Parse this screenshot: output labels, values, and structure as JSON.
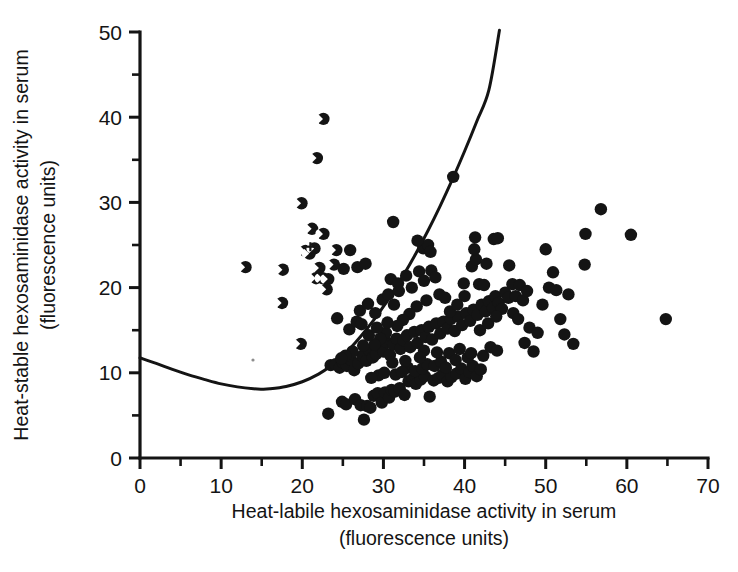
{
  "chart_data": {
    "type": "scatter",
    "title": "",
    "xlabel": "Heat-labile hexosaminidase activity in serum",
    "xlabel_units": "(fluorescence units)",
    "ylabel": "Heat-stable hexosaminidase activity in serum",
    "ylabel_units": "(fluorescence units)",
    "xlim": [
      0,
      70
    ],
    "ylim": [
      0,
      50
    ],
    "x_major_ticks": [
      0,
      10,
      20,
      30,
      40,
      50,
      60,
      70
    ],
    "x_minor_ticks": [
      5,
      15,
      25,
      35,
      45,
      55,
      65
    ],
    "y_major_ticks": [
      0,
      10,
      20,
      30,
      40,
      50
    ],
    "y_minor_ticks": [
      5,
      15,
      25,
      35,
      45
    ],
    "x_tick_labels": [
      "0",
      "10",
      "20",
      "30",
      "40",
      "50",
      "60",
      "70"
    ],
    "y_tick_labels": [
      "0",
      "10",
      "20",
      "30",
      "40",
      "50"
    ],
    "grid": false,
    "legend": "none",
    "marker_color": "#141414",
    "curve_color": "#141414",
    "series": [
      {
        "name": "filled-circle-group",
        "marker": "filled-circle",
        "points": [
          [
            23.2,
            5.2
          ],
          [
            24.9,
            6.6
          ],
          [
            25.4,
            6.3
          ],
          [
            26.5,
            6.9
          ],
          [
            27.2,
            6.2
          ],
          [
            27.6,
            4.5
          ],
          [
            28.0,
            6.1
          ],
          [
            28.4,
            5.9
          ],
          [
            28.8,
            7.3
          ],
          [
            29.3,
            7.6
          ],
          [
            29.8,
            6.5
          ],
          [
            30.2,
            7.7
          ],
          [
            30.7,
            7.1
          ],
          [
            31.0,
            8.0
          ],
          [
            31.4,
            7.8
          ],
          [
            32.0,
            8.2
          ],
          [
            32.6,
            7.4
          ],
          [
            33.1,
            9.0
          ],
          [
            33.6,
            9.3
          ],
          [
            34.0,
            8.7
          ],
          [
            34.6,
            9.2
          ],
          [
            35.1,
            9.6
          ],
          [
            35.7,
            7.2
          ],
          [
            36.2,
            9.1
          ],
          [
            36.8,
            9.4
          ],
          [
            37.3,
            9.8
          ],
          [
            37.9,
            9.0
          ],
          [
            38.4,
            9.5
          ],
          [
            39.0,
            9.9
          ],
          [
            39.6,
            10.5
          ],
          [
            40.1,
            9.3
          ],
          [
            40.6,
            10.1
          ],
          [
            41.0,
            10.8
          ],
          [
            41.5,
            9.6
          ],
          [
            42.0,
            10.4
          ],
          [
            23.5,
            10.9
          ],
          [
            24.1,
            11.0
          ],
          [
            24.6,
            10.6
          ],
          [
            25.0,
            11.2
          ],
          [
            25.5,
            10.8
          ],
          [
            26.0,
            11.5
          ],
          [
            26.4,
            10.3
          ],
          [
            26.9,
            11.1
          ],
          [
            27.4,
            12.0
          ],
          [
            27.9,
            11.4
          ],
          [
            28.3,
            12.6
          ],
          [
            28.7,
            11.8
          ],
          [
            29.1,
            12.2
          ],
          [
            29.5,
            13.1
          ],
          [
            30.0,
            12.5
          ],
          [
            30.4,
            13.6
          ],
          [
            30.8,
            12.1
          ],
          [
            31.2,
            13.3
          ],
          [
            31.6,
            14.0
          ],
          [
            32.1,
            12.8
          ],
          [
            32.5,
            13.8
          ],
          [
            32.9,
            14.4
          ],
          [
            33.3,
            13.0
          ],
          [
            33.8,
            14.8
          ],
          [
            34.2,
            13.5
          ],
          [
            34.7,
            15.0
          ],
          [
            35.2,
            14.2
          ],
          [
            35.6,
            15.4
          ],
          [
            36.0,
            13.9
          ],
          [
            36.5,
            15.8
          ],
          [
            37.0,
            14.6
          ],
          [
            37.4,
            16.0
          ],
          [
            37.9,
            15.2
          ],
          [
            38.3,
            16.3
          ],
          [
            38.8,
            14.9
          ],
          [
            39.2,
            16.6
          ],
          [
            39.7,
            15.6
          ],
          [
            40.2,
            17.0
          ],
          [
            40.7,
            16.1
          ],
          [
            41.1,
            17.4
          ],
          [
            41.6,
            16.8
          ],
          [
            42.1,
            18.0
          ],
          [
            42.6,
            17.2
          ],
          [
            43.0,
            18.4
          ],
          [
            43.5,
            17.6
          ],
          [
            24.3,
            16.4
          ],
          [
            25.8,
            15.1
          ],
          [
            26.7,
            16.0
          ],
          [
            27.1,
            17.3
          ],
          [
            28.1,
            18.1
          ],
          [
            29.0,
            17.0
          ],
          [
            29.9,
            18.6
          ],
          [
            30.6,
            19.2
          ],
          [
            31.3,
            18.0
          ],
          [
            31.9,
            19.6
          ],
          [
            30.9,
            21.0
          ],
          [
            31.8,
            20.5
          ],
          [
            32.8,
            21.4
          ],
          [
            33.5,
            20.0
          ],
          [
            34.4,
            21.9
          ],
          [
            35.0,
            20.8
          ],
          [
            35.9,
            22.0
          ],
          [
            36.4,
            21.2
          ],
          [
            34.9,
            24.6
          ],
          [
            35.5,
            25.0
          ],
          [
            34.2,
            25.5
          ],
          [
            35.8,
            24.2
          ],
          [
            31.2,
            27.7
          ],
          [
            26.8,
            22.4
          ],
          [
            27.8,
            22.8
          ],
          [
            25.9,
            24.4
          ],
          [
            25.1,
            22.2
          ],
          [
            38.6,
            33.0
          ],
          [
            43.8,
            19.0
          ],
          [
            44.2,
            18.2
          ],
          [
            44.6,
            17.5
          ],
          [
            45.0,
            19.4
          ],
          [
            45.4,
            18.8
          ],
          [
            45.9,
            20.4
          ],
          [
            46.3,
            19.0
          ],
          [
            46.8,
            20.3
          ],
          [
            47.2,
            18.5
          ],
          [
            47.7,
            19.6
          ],
          [
            41.8,
            20.4
          ],
          [
            42.4,
            20.3
          ],
          [
            40.9,
            22.5
          ],
          [
            41.4,
            23.3
          ],
          [
            41.2,
            24.5
          ],
          [
            41.3,
            25.9
          ],
          [
            43.6,
            25.7
          ],
          [
            44.1,
            25.8
          ],
          [
            42.7,
            22.8
          ],
          [
            45.5,
            22.6
          ],
          [
            46.0,
            17.0
          ],
          [
            46.6,
            16.3
          ],
          [
            47.4,
            13.5
          ],
          [
            48.0,
            15.3
          ],
          [
            48.5,
            12.5
          ],
          [
            49.0,
            14.7
          ],
          [
            49.6,
            18.0
          ],
          [
            50.0,
            24.5
          ],
          [
            50.4,
            20.0
          ],
          [
            50.9,
            21.8
          ],
          [
            51.3,
            19.7
          ],
          [
            51.8,
            16.3
          ],
          [
            52.3,
            14.5
          ],
          [
            52.8,
            19.2
          ],
          [
            53.4,
            13.4
          ],
          [
            54.8,
            22.7
          ],
          [
            54.9,
            26.3
          ],
          [
            56.8,
            29.2
          ],
          [
            60.5,
            26.2
          ],
          [
            64.8,
            16.3
          ],
          [
            38.1,
            12.3
          ],
          [
            38.9,
            11.5
          ],
          [
            39.4,
            12.8
          ],
          [
            40.4,
            11.8
          ],
          [
            40.8,
            12.3
          ],
          [
            42.3,
            12.0
          ],
          [
            43.2,
            13.0
          ],
          [
            44.0,
            12.6
          ],
          [
            33.0,
            10.6
          ],
          [
            33.9,
            10.2
          ],
          [
            34.8,
            10.5
          ],
          [
            35.4,
            11.0
          ],
          [
            36.3,
            10.8
          ],
          [
            37.1,
            11.3
          ],
          [
            37.7,
            10.6
          ],
          [
            29.4,
            9.7
          ],
          [
            30.1,
            10.0
          ],
          [
            31.5,
            9.8
          ],
          [
            32.3,
            10.1
          ],
          [
            28.5,
            9.4
          ],
          [
            36.9,
            19.2
          ],
          [
            37.6,
            18.8
          ],
          [
            35.3,
            18.5
          ],
          [
            34.1,
            17.8
          ],
          [
            33.2,
            16.9
          ],
          [
            32.4,
            16.2
          ],
          [
            31.7,
            15.5
          ],
          [
            30.3,
            14.7
          ],
          [
            29.6,
            14.0
          ],
          [
            28.9,
            13.3
          ],
          [
            28.2,
            14.4
          ],
          [
            27.5,
            13.2
          ],
          [
            26.2,
            12.5
          ],
          [
            25.3,
            12.0
          ],
          [
            24.8,
            11.7
          ],
          [
            39.9,
            20.5
          ],
          [
            40.0,
            19.0
          ],
          [
            41.9,
            15.0
          ],
          [
            42.9,
            15.8
          ],
          [
            43.9,
            16.6
          ],
          [
            36.6,
            12.4
          ],
          [
            35.0,
            12.6
          ],
          [
            34.5,
            11.8
          ],
          [
            32.7,
            11.4
          ],
          [
            31.1,
            11.2
          ],
          [
            38.2,
            17.2
          ],
          [
            39.1,
            18.0
          ],
          [
            30.5,
            15.9
          ],
          [
            29.2,
            15.3
          ],
          [
            27.3,
            15.7
          ]
        ]
      },
      {
        "name": "half-filled-circle-group",
        "marker": "half-filled-circle",
        "points": [
          [
            22.6,
            39.8
          ],
          [
            21.8,
            35.2
          ],
          [
            19.9,
            29.9
          ],
          [
            21.2,
            26.9
          ],
          [
            22.6,
            26.3
          ],
          [
            20.4,
            24.3
          ],
          [
            20.9,
            24.0
          ],
          [
            21.5,
            24.6
          ],
          [
            24.2,
            24.4
          ],
          [
            13.0,
            22.4
          ],
          [
            17.6,
            22.1
          ],
          [
            22.1,
            22.3
          ],
          [
            23.9,
            22.7
          ],
          [
            21.7,
            21.1
          ],
          [
            22.5,
            21.1
          ],
          [
            23.2,
            21.0
          ],
          [
            23.0,
            19.8
          ],
          [
            17.5,
            18.2
          ],
          [
            19.8,
            13.4
          ]
        ]
      },
      {
        "name": "cross-marker",
        "marker": "cross",
        "points": [
          [
            21.0,
            24.8
          ]
        ]
      }
    ],
    "curve": {
      "name": "discriminant-curve",
      "style": "solid",
      "points": [
        [
          0.0,
          11.75
        ],
        [
          2.0,
          11.1
        ],
        [
          4.0,
          10.4
        ],
        [
          6.0,
          9.75
        ],
        [
          8.0,
          9.2
        ],
        [
          10.0,
          8.7
        ],
        [
          12.0,
          8.35
        ],
        [
          14.0,
          8.12
        ],
        [
          15.0,
          8.08
        ],
        [
          16.0,
          8.12
        ],
        [
          18.0,
          8.4
        ],
        [
          20.0,
          8.95
        ],
        [
          22.0,
          9.85
        ],
        [
          23.5,
          10.8
        ],
        [
          25.0,
          12.0
        ],
        [
          26.5,
          13.5
        ],
        [
          28.0,
          15.2
        ],
        [
          29.5,
          17.1
        ],
        [
          31.0,
          19.2
        ],
        [
          32.5,
          21.5
        ],
        [
          34.0,
          24.0
        ],
        [
          35.5,
          26.7
        ],
        [
          37.0,
          29.6
        ],
        [
          38.5,
          32.7
        ],
        [
          40.0,
          36.0
        ],
        [
          41.5,
          39.5
        ],
        [
          43.0,
          43.2
        ],
        [
          44.3,
          50.2
        ]
      ]
    }
  },
  "figure": {
    "background_color": "#ffffff"
  }
}
